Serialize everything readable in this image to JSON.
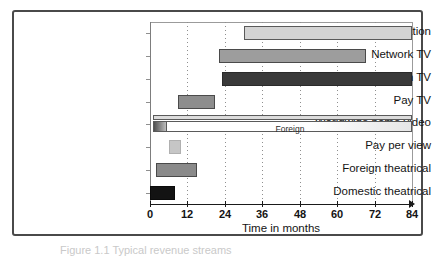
{
  "figure": {
    "caption": "Figure 1.1  Typical revenue streams"
  },
  "chart_data": {
    "type": "bar",
    "orientation": "horizontal",
    "title": "",
    "xlabel": "Time in months",
    "ylabel": "",
    "xlim": [
      0,
      84
    ],
    "xticks": [
      0,
      12,
      24,
      36,
      48,
      60,
      72,
      84
    ],
    "xticklabels": [
      "0",
      "12",
      "24",
      "36",
      "48",
      "60",
      "72",
      "84"
    ],
    "grid": "vertical-dotted",
    "legend": "none",
    "categories": [
      "Syndication",
      "Network TV",
      "Foreign TV",
      "Pay TV",
      "Worldwide home video",
      "Pay per view",
      "Foreign theatrical",
      "Domestic theatrical"
    ],
    "bars": [
      {
        "label": "Syndication",
        "start": 30,
        "end": 84,
        "color": "#d4d4d4",
        "border": "#5a5a5a"
      },
      {
        "label": "Network TV",
        "start": 22,
        "end": 69,
        "color": "#9d9d9d",
        "border": "#4a4a4a"
      },
      {
        "label": "Foreign TV",
        "start": 23,
        "end": 84,
        "color": "#3a3a3a",
        "border": "#2a2a2a"
      },
      {
        "label": "Pay TV",
        "start": 9,
        "end": 21,
        "color": "#8d8d8d",
        "border": "#4a4a4a"
      },
      {
        "label": "Worldwide home video",
        "start": 1,
        "end": 84,
        "color": "#dcdcdc",
        "border": "#5a5a5a"
      },
      {
        "label": "Pay per view",
        "start": 6,
        "end": 10,
        "color": "#c6c6c6",
        "border": "#b0b0b0"
      },
      {
        "label": "Foreign theatrical",
        "start": 2,
        "end": 15,
        "color": "#8a8a8a",
        "border": "#4a4a4a"
      },
      {
        "label": "Domestic theatrical",
        "start": 0,
        "end": 8,
        "color": "#131313",
        "border": "#0a0a0a"
      }
    ],
    "annotations": [
      {
        "text": "Foreign",
        "row": "Worldwide home video",
        "x": 45
      }
    ]
  },
  "colors": {
    "axis": "#141414",
    "grid": "#8f8f8f",
    "frame": "#4a4a4a",
    "plot_background": "#ffffff"
  }
}
